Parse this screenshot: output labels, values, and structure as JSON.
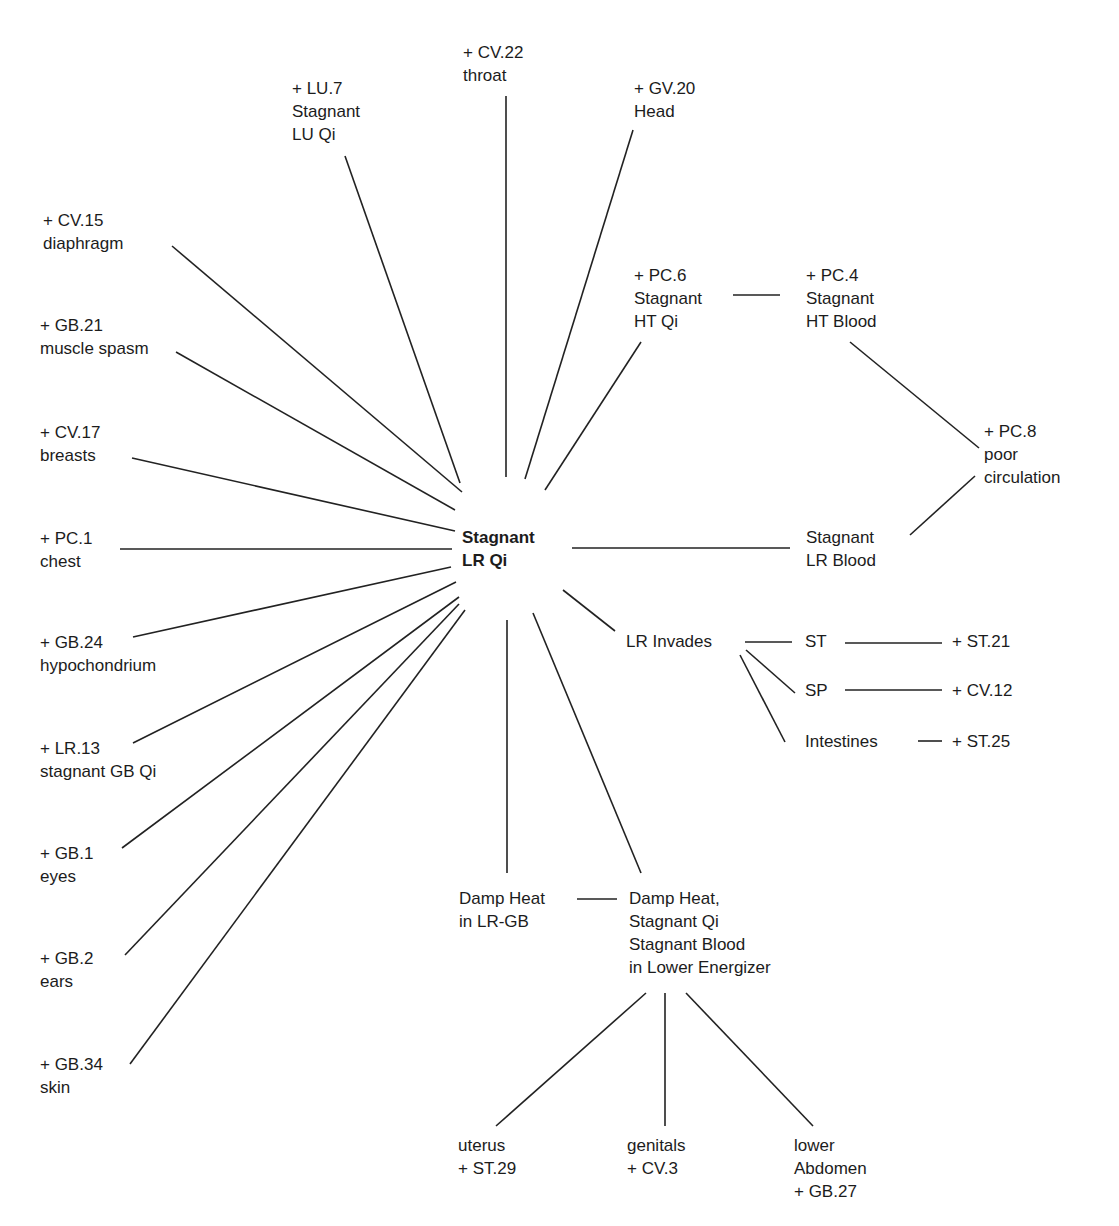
{
  "diagram": {
    "title": "Stagnant LR Qi",
    "hub": {
      "line1": "Stagnant",
      "line2": "LR Qi"
    },
    "nodes": {
      "cv22": {
        "l1": "+ CV.22",
        "l2": "throat"
      },
      "lu7": {
        "l1": "+ LU.7",
        "l2": "Stagnant",
        "l3": "LU Qi"
      },
      "gv20": {
        "l1": "+ GV.20",
        "l2": "Head"
      },
      "cv15": {
        "l1": "+ CV.15",
        "l2": "diaphragm"
      },
      "gb21": {
        "l1": "+ GB.21",
        "l2": "muscle spasm"
      },
      "cv17": {
        "l1": "+ CV.17",
        "l2": "breasts"
      },
      "pc1": {
        "l1": "+ PC.1",
        "l2": "chest"
      },
      "gb24": {
        "l1": "+ GB.24",
        "l2": "hypochondrium"
      },
      "lr13": {
        "l1": "+ LR.13",
        "l2": "stagnant GB Qi"
      },
      "gb1": {
        "l1": "+ GB.1",
        "l2": "eyes"
      },
      "gb2": {
        "l1": "+ GB.2",
        "l2": "ears"
      },
      "gb34": {
        "l1": "+ GB.34",
        "l2": "skin"
      },
      "pc6": {
        "l1": "+ PC.6",
        "l2": "Stagnant",
        "l3": "HT Qi"
      },
      "pc4": {
        "l1": "+ PC.4",
        "l2": "Stagnant",
        "l3": "HT Blood"
      },
      "pc8": {
        "l1": "+ PC.8",
        "l2": "poor",
        "l3": "circulation"
      },
      "lrblood": {
        "l1": "Stagnant",
        "l2": "LR Blood"
      },
      "lrinvades": {
        "l1": "LR Invades"
      },
      "st": {
        "l1": "ST"
      },
      "sp": {
        "l1": "SP"
      },
      "intestines": {
        "l1": "Intestines"
      },
      "st21": {
        "l1": "+ ST.21"
      },
      "cv12": {
        "l1": "+ CV.12"
      },
      "st25": {
        "l1": "+ ST.25"
      },
      "dhlrgb": {
        "l1": "Damp Heat",
        "l2": "in LR-GB"
      },
      "dhle": {
        "l1": "Damp Heat,",
        "l2": "Stagnant Qi",
        "l3": "Stagnant Blood",
        "l4": "in Lower Energizer"
      },
      "uterus": {
        "l1": "uterus",
        "l2": "+ ST.29"
      },
      "genitals": {
        "l1": "genitals",
        "l2": "+ CV.3"
      },
      "abdomen": {
        "l1": "lower",
        "l2": "Abdomen",
        "l3": "+ GB.27"
      }
    },
    "edges": [
      [
        "Stagnant LR Qi",
        "+ CV.15 diaphragm"
      ],
      [
        "Stagnant LR Qi",
        "+ GB.21 muscle spasm"
      ],
      [
        "Stagnant LR Qi",
        "+ CV.17 breasts"
      ],
      [
        "Stagnant LR Qi",
        "+ PC.1 chest"
      ],
      [
        "Stagnant LR Qi",
        "+ GB.24 hypochondrium"
      ],
      [
        "Stagnant LR Qi",
        "+ LR.13 stagnant GB Qi"
      ],
      [
        "Stagnant LR Qi",
        "+ GB.1 eyes"
      ],
      [
        "Stagnant LR Qi",
        "+ GB.2 ears"
      ],
      [
        "Stagnant LR Qi",
        "+ GB.34 skin"
      ],
      [
        "Stagnant LR Qi",
        "+ LU.7 Stagnant LU Qi"
      ],
      [
        "Stagnant LR Qi",
        "+ CV.22 throat"
      ],
      [
        "Stagnant LR Qi",
        "+ GV.20 Head"
      ],
      [
        "Stagnant LR Qi",
        "+ PC.6 Stagnant HT Qi"
      ],
      [
        "+ PC.6 Stagnant HT Qi",
        "+ PC.4 Stagnant HT Blood"
      ],
      [
        "+ PC.4 Stagnant HT Blood",
        "+ PC.8 poor circulation"
      ],
      [
        "Stagnant LR Blood",
        "+ PC.8 poor circulation"
      ],
      [
        "Stagnant LR Qi",
        "Stagnant LR Blood"
      ],
      [
        "Stagnant LR Qi",
        "LR Invades"
      ],
      [
        "LR Invades",
        "ST"
      ],
      [
        "LR Invades",
        "SP"
      ],
      [
        "LR Invades",
        "Intestines"
      ],
      [
        "ST",
        "+ ST.21"
      ],
      [
        "SP",
        "+ CV.12"
      ],
      [
        "Intestines",
        "+ ST.25"
      ],
      [
        "Stagnant LR Qi",
        "Damp Heat in LR-GB"
      ],
      [
        "Stagnant LR Qi",
        "Damp Heat, Stagnant Qi Stagnant Blood in Lower Energizer"
      ],
      [
        "Damp Heat in LR-GB",
        "Damp Heat, Stagnant Qi Stagnant Blood in Lower Energizer"
      ],
      [
        "Damp Heat, Stagnant Qi Stagnant Blood in Lower Energizer",
        "uterus + ST.29"
      ],
      [
        "Damp Heat, Stagnant Qi Stagnant Blood in Lower Energizer",
        "genitals + CV.3"
      ],
      [
        "Damp Heat, Stagnant Qi Stagnant Blood in Lower Energizer",
        "lower Abdomen + GB.27"
      ]
    ]
  }
}
